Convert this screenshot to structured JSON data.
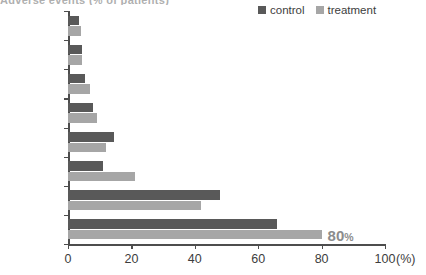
{
  "title": "Adverse events (% of patients)",
  "legend": {
    "position": "top-right",
    "entries": [
      {
        "label": "control",
        "color": "#595959"
      },
      {
        "label": "treatment",
        "color": "#a6a6a6"
      }
    ]
  },
  "axis": {
    "x_unit": "(%)",
    "ticks": [
      "0",
      "20",
      "40",
      "60",
      "80",
      "100"
    ]
  },
  "annotations": [
    {
      "num": "80",
      "unit": "%",
      "series": "treatment",
      "category": "Rash"
    }
  ],
  "chart_data": {
    "type": "bar",
    "orientation": "horizontal",
    "title": "Adverse events (% of patients)",
    "xlabel": "(%)",
    "ylabel": "",
    "xlim": [
      0,
      100
    ],
    "grid": false,
    "legend_position": "top-right",
    "xticks": [
      0,
      20,
      40,
      60,
      80,
      100
    ],
    "categories": [
      "Vomitting",
      "Headache",
      "Dyspnea",
      "Fatigue",
      "Nausea",
      "Anemia",
      "Diarrhea",
      "Rash"
    ],
    "series": [
      {
        "name": "control",
        "color": "#595959",
        "values": [
          3.5,
          4.5,
          5.5,
          8,
          14.5,
          11,
          48,
          66
        ]
      },
      {
        "name": "treatment",
        "color": "#a6a6a6",
        "values": [
          4,
          4.5,
          7,
          9,
          12,
          21,
          42,
          80
        ]
      }
    ],
    "annotations": [
      {
        "text": "80%",
        "category": "Rash",
        "series": "treatment",
        "value": 80
      }
    ]
  }
}
